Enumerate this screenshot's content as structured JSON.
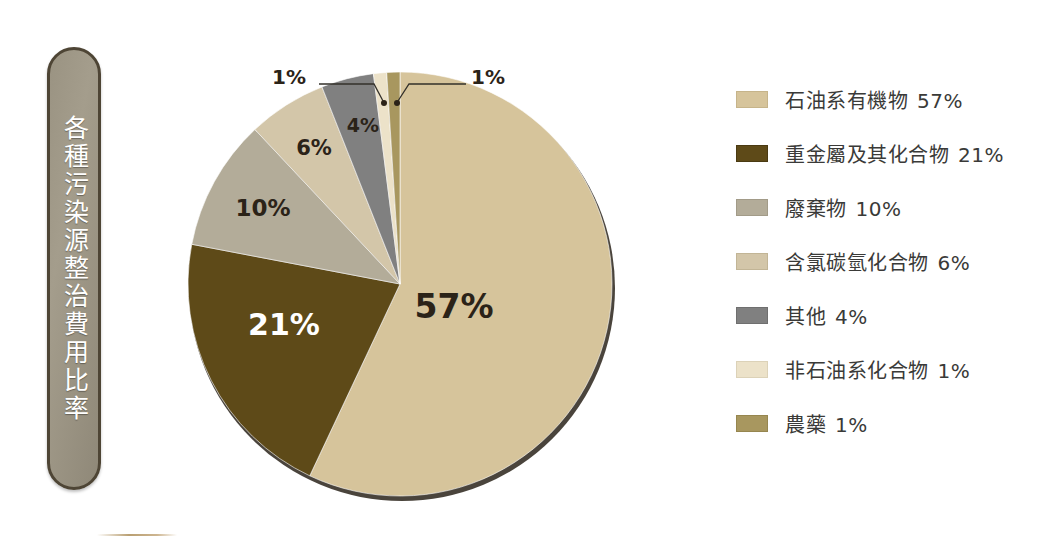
{
  "title": {
    "vertical_text": "各種污染源整治費用比率",
    "pill_fill": "#9a9382",
    "pill_border": "#4e4535",
    "text_color": "#ffffff"
  },
  "chart_data": {
    "type": "pie",
    "title": "各種污染源整治費用比率",
    "legend_position": "right",
    "start_angle_deg": 0,
    "direction": "clockwise",
    "categories": [
      "石油系有機物",
      "重金屬及其化合物",
      "廢棄物",
      "含氯碳氫化合物",
      "其他",
      "非石油系化合物",
      "農藥"
    ],
    "values": [
      57,
      21,
      10,
      6,
      4,
      1,
      1
    ],
    "value_labels": [
      "57%",
      "21%",
      "10%",
      "6%",
      "4%",
      "1%",
      "1%"
    ],
    "colors": [
      "#d6c49b",
      "#5e4a18",
      "#b3ac99",
      "#d3c6a9",
      "#808080",
      "#ece2c9",
      "#a8975f"
    ],
    "label_text_colors": [
      "#2b2318",
      "#ffffff",
      "#2b2318",
      "#2b2318",
      "#2b2318",
      "#2b2318",
      "#2b2318"
    ],
    "unit": "%",
    "rim_shadow_color": "#4a443c"
  },
  "pie_labels": [
    {
      "text": "57%",
      "x": 276,
      "y": 258,
      "size": 33,
      "color": "#2b2318",
      "anchor": "middle"
    },
    {
      "text": "21%",
      "x": 106,
      "y": 275,
      "size": 30,
      "color": "#ffffff",
      "anchor": "middle"
    },
    {
      "text": "10%",
      "x": 85,
      "y": 156,
      "size": 23,
      "color": "#2b2318",
      "anchor": "middle"
    },
    {
      "text": "6%",
      "x": 136,
      "y": 95,
      "size": 21,
      "color": "#2b2318",
      "anchor": "middle"
    },
    {
      "text": "4%",
      "x": 185,
      "y": 72,
      "size": 19,
      "color": "#2b2318",
      "anchor": "middle"
    }
  ],
  "callouts": [
    {
      "name": "callout-nonpetroleum",
      "text": "1%",
      "label_x": 128,
      "label_y": 16,
      "anchor": "end",
      "line": "M 141 24 L 196 24 L 205 41",
      "dot_x": 206,
      "dot_y": 43
    },
    {
      "name": "callout-pesticide",
      "text": "1%",
      "label_x": 293,
      "label_y": 16,
      "anchor": "start",
      "line": "M 288 24 L 231 24 L 220 41",
      "dot_x": 219,
      "dot_y": 43
    }
  ],
  "legend": {
    "items": [
      {
        "label": "石油系有機物",
        "percent": "57%",
        "color": "#d6c49b",
        "border": "#c6b48a"
      },
      {
        "label": "重金屬及其化合物",
        "percent": "21%",
        "color": "#5e4a18",
        "border": "#4a3a12"
      },
      {
        "label": "廢棄物",
        "percent": "10%",
        "color": "#b3ac99",
        "border": "#a29b88"
      },
      {
        "label": "含氯碳氫化合物",
        "percent": "6%",
        "color": "#d3c6a9",
        "border": "#c2b596"
      },
      {
        "label": "其他",
        "percent": "4%",
        "color": "#808080",
        "border": "#6f6f6f"
      },
      {
        "label": "非石油系化合物",
        "percent": "1%",
        "color": "#ece2c9",
        "border": "#dcd2b8"
      },
      {
        "label": "農藥",
        "percent": "1%",
        "color": "#a8975f",
        "border": "#96864f"
      }
    ]
  }
}
